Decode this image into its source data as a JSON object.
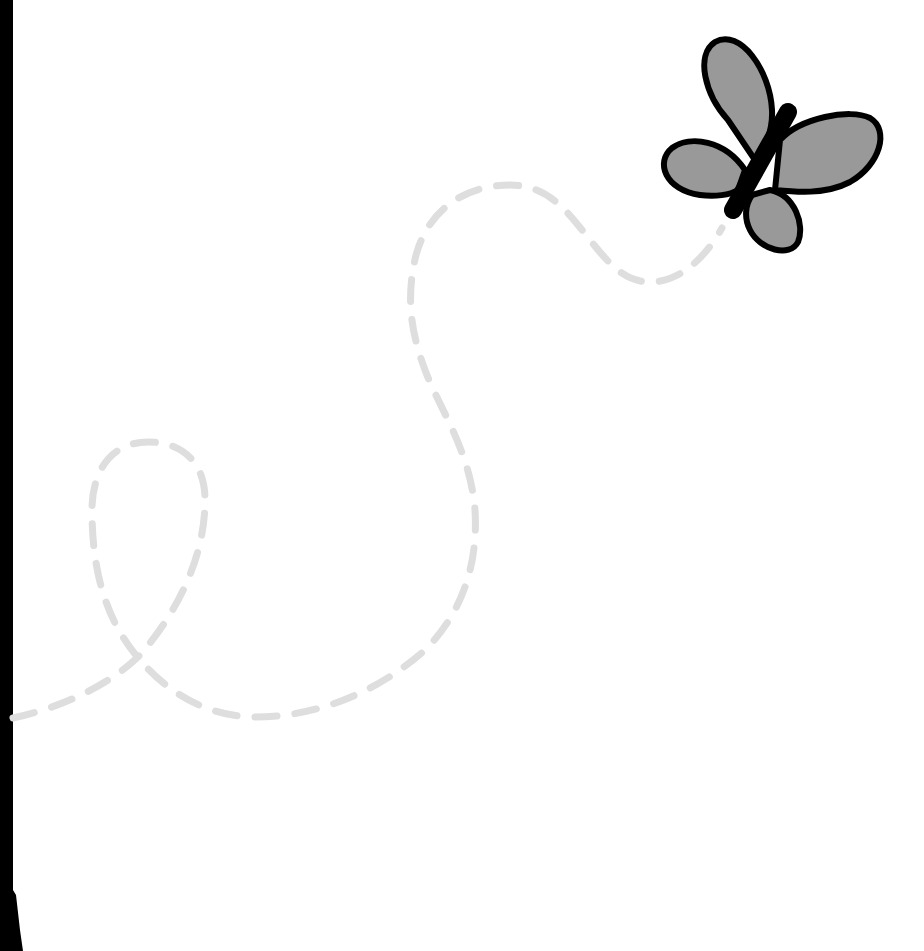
{
  "scene": {
    "description": "Cartoon butterfly with a dashed flight path on white background",
    "background_color": "#ffffff",
    "left_bar_color": "#000000",
    "path_color": "#dedede",
    "butterfly": {
      "wing_color": "#999999",
      "outline_color": "#000000",
      "body_color": "#000000"
    }
  }
}
